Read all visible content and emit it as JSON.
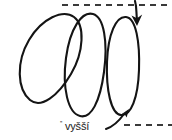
{
  "figure": {
    "background_color": "#ffffff",
    "ink_color": "#141414",
    "guide_color": "#3a3a3a",
    "width": 172,
    "height": 140
  },
  "caption": {
    "superscript_mark": "''",
    "label": "vyšší"
  },
  "loops": [
    {
      "name": "loop-left",
      "cx": 46,
      "cy": 58,
      "rx": 17,
      "ry": 47,
      "rotation_deg": -32
    },
    {
      "name": "loop-middle",
      "cx": 86,
      "cy": 66,
      "rx": 17,
      "ry": 50,
      "rotation_deg": -10
    },
    {
      "name": "loop-right",
      "cx": 123,
      "cy": 66,
      "rx": 15,
      "ry": 49,
      "rotation_deg": -2
    }
  ],
  "guides": [
    {
      "name": "top-dashed-guide",
      "x1": 62,
      "y1": 5,
      "x2": 172,
      "y2": 5,
      "dash": "6 5"
    },
    {
      "name": "bottom-dashed-guide",
      "x1": 124,
      "y1": 125,
      "x2": 172,
      "y2": 125,
      "dash": "6 5"
    }
  ],
  "arrows": [
    {
      "name": "down-arrow",
      "direction": "down",
      "tail": [
        136,
        1
      ],
      "tip": [
        137,
        25
      ]
    },
    {
      "name": "up-right-arrow",
      "direction": "up-right",
      "tail": [
        106,
        129
      ],
      "tip": [
        128,
        110
      ]
    }
  ]
}
